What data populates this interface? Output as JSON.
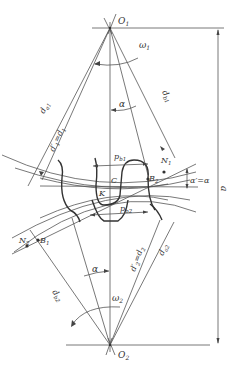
{
  "diagram": {
    "type": "gear-meshing-geometry",
    "labels": {
      "O1": "O",
      "O1_sub": "1",
      "O2": "O",
      "O2_sub": "2",
      "omega1": "ω",
      "omega1_sub": "1",
      "omega2": "ω",
      "omega2_sub": "2",
      "alpha_top": "α",
      "alpha_bottom": "α",
      "da1": "d",
      "da1_sub": "a1",
      "d1": "d′",
      "d1_sub": "1",
      "d1_eq": "=d",
      "d1_eq_sub": "1",
      "db1": "d",
      "db1_sub": "b1",
      "pb1": "p",
      "pb1_sub": "b1",
      "pb2": "p",
      "pb2_sub": "b2",
      "N1": "N",
      "N1_sub": "1",
      "N2": "N",
      "N2_sub": "2",
      "B1": "B",
      "B1_sub": "1",
      "B2": "B",
      "B2_sub": "2",
      "K": "K",
      "C": "C",
      "alpha_prime_eq": "α′=α",
      "center_distance": "a",
      "db2": "d",
      "db2_sub": "b2",
      "d2": "d′",
      "d2_sub": "2",
      "d2_eq": "=d",
      "d2_eq_sub": "2",
      "da2": "d",
      "da2_sub": "a2"
    }
  }
}
